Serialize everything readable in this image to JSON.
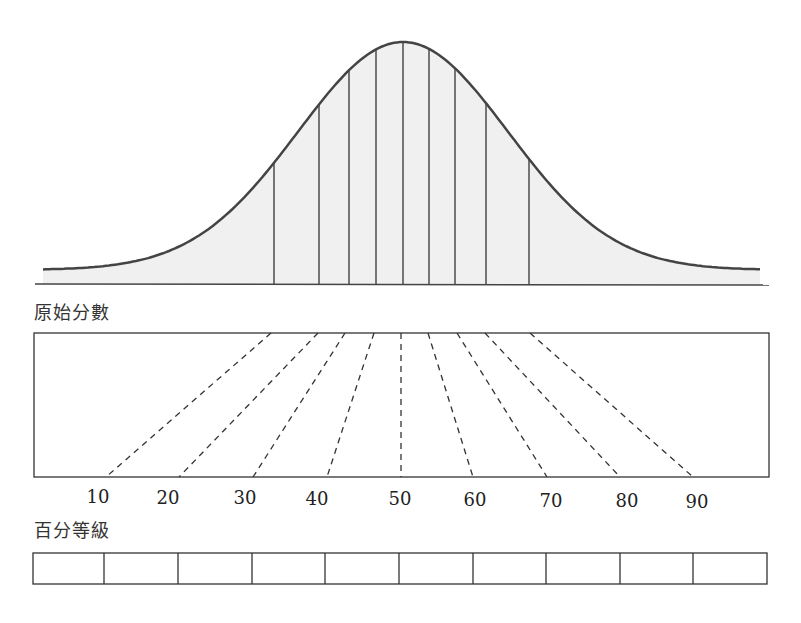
{
  "labels": {
    "raw_score": "原始分數",
    "percentile_rank": "百分等級"
  },
  "chart_data": {
    "type": "diagram",
    "title": "",
    "curve": {
      "peak_x": 403,
      "peak_y": 42,
      "baseline_y": 284,
      "sigma_px": 105,
      "x_start": 43,
      "x_end": 760,
      "fill": "#f0f0f0",
      "stroke": "#444444",
      "decile_lines_x": [
        274,
        319,
        349,
        376,
        403,
        429,
        455,
        486,
        529
      ]
    },
    "mapping": {
      "box": {
        "x": 34,
        "y": 333,
        "w": 735,
        "h": 144
      },
      "top_x": [
        271,
        318,
        345,
        374,
        401,
        428,
        457,
        485,
        530
      ],
      "bottom_x": [
        106,
        179,
        253,
        327,
        401,
        473,
        547,
        620,
        693
      ]
    },
    "percentile_ticks": [
      "10",
      "20",
      "30",
      "40",
      "50",
      "60",
      "70",
      "80",
      "90"
    ],
    "percentile_tick_x": [
      98,
      168,
      245,
      317,
      400,
      475,
      551,
      627,
      697
    ],
    "percentile_bar": {
      "x": 33,
      "y": 553,
      "w": 734,
      "h": 31,
      "cells": 10,
      "dividers_x": [
        104,
        178,
        252,
        325,
        399,
        473,
        546,
        620,
        693
      ]
    }
  }
}
